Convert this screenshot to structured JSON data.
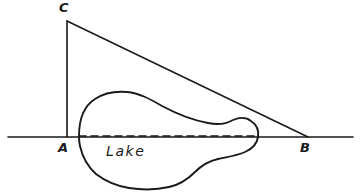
{
  "figure": {
    "kind": "hand-drawn-geometry-diagram",
    "width": 361,
    "height": 196,
    "background_color": "#ffffff",
    "ink_color": "#1a1a1a"
  },
  "labels": {
    "vertex_c": "C",
    "vertex_a": "A",
    "vertex_b": "B",
    "lake": "Lake"
  },
  "geometry": {
    "points": {
      "A": [
        67,
        137
      ],
      "B": [
        308,
        137
      ],
      "C": [
        67,
        21
      ]
    },
    "baseline": {
      "name": "ground-line",
      "x_start": 8,
      "x_end": 353,
      "y": 137,
      "style": "solid"
    },
    "vertical_leg": {
      "name": "segment-CA",
      "from": [
        67,
        21
      ],
      "to": [
        67,
        137
      ],
      "style": "solid"
    },
    "hypotenuse": {
      "name": "segment-CB",
      "from": [
        67,
        21
      ],
      "to": [
        308,
        137
      ],
      "style": "solid"
    },
    "chord": {
      "name": "segment-AB-across-lake",
      "from": [
        79,
        136
      ],
      "to": [
        256,
        136
      ],
      "style": "dashed",
      "dash_pattern": "7 5"
    },
    "lake_outline_path": "M 79 136 C 79 120 84 106 95 99 C 104 93 116 91 127 92 C 139 93 150 99 162 106 C 177 114 192 120 208 123 C 217 125 226 124 233 120 C 240 117 246 117 251 121 C 257 125 259 131 258 137 C 257 144 252 149 245 152 C 236 156 227 157 218 159 C 209 161 201 166 195 172 C 188 179 179 185 169 187 C 156 190 142 190 129 188 C 117 186 105 181 96 174 C 87 166 82 155 80 146 C 79 142 79 139 79 136 Z"
  }
}
